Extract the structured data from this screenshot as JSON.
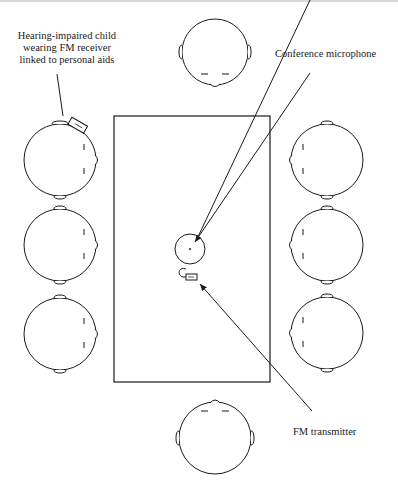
{
  "diagram": {
    "labels": {
      "child": [
        "Hearing-impaired child",
        "wearing FM receiver",
        "linked to personal aids"
      ],
      "microphone": "Conference microphone",
      "transmitter": "FM transmitter"
    },
    "table": {
      "x": 114,
      "y": 116,
      "width": 156,
      "height": 266
    },
    "microphone": {
      "cx": 190,
      "cy": 249,
      "r": 15
    },
    "transmitter": {
      "x": 186,
      "y": 274,
      "width": 11,
      "height": 6
    },
    "heads": [
      {
        "id": "top",
        "cx": 215,
        "cy": 52,
        "facing": "down"
      },
      {
        "id": "left-1",
        "cx": 60,
        "cy": 160,
        "facing": "right",
        "note": "FM receiver"
      },
      {
        "id": "left-2",
        "cx": 60,
        "cy": 245,
        "facing": "right"
      },
      {
        "id": "left-3",
        "cx": 60,
        "cy": 334,
        "facing": "right"
      },
      {
        "id": "right-1",
        "cx": 327,
        "cy": 160,
        "facing": "left"
      },
      {
        "id": "right-2",
        "cx": 327,
        "cy": 245,
        "facing": "left"
      },
      {
        "id": "right-3",
        "cx": 327,
        "cy": 333,
        "facing": "left"
      },
      {
        "id": "bottom",
        "cx": 215,
        "cy": 438,
        "facing": "up"
      }
    ]
  }
}
